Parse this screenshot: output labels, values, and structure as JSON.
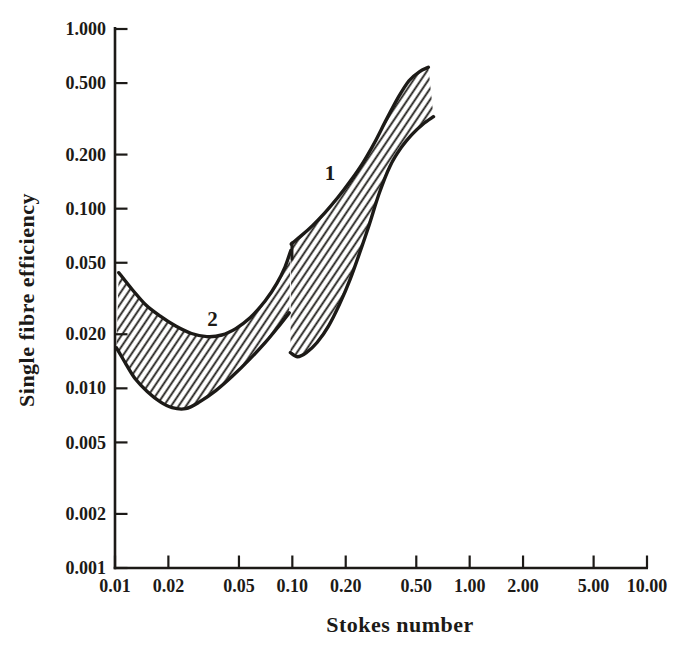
{
  "figure": {
    "background": "#ffffff",
    "ink": "#1c1a17"
  },
  "chart_data": {
    "type": "area",
    "title": "",
    "xlabel": "Stokes number",
    "ylabel": "Single fibre efficiency",
    "x_scale": "log",
    "y_scale": "log",
    "xlim": [
      0.01,
      10.0
    ],
    "ylim": [
      0.001,
      1.0
    ],
    "grid": false,
    "legend": "none",
    "x_ticks": [
      {
        "value": 0.01,
        "label": "0.01"
      },
      {
        "value": 0.02,
        "label": "0.02"
      },
      {
        "value": 0.05,
        "label": "0.05"
      },
      {
        "value": 0.1,
        "label": "0.10"
      },
      {
        "value": 0.2,
        "label": "0.20"
      },
      {
        "value": 0.5,
        "label": "0.50"
      },
      {
        "value": 1.0,
        "label": "1.00"
      },
      {
        "value": 2.0,
        "label": "2.00"
      },
      {
        "value": 5.0,
        "label": "5.00"
      },
      {
        "value": 10.0,
        "label": "10.00"
      }
    ],
    "y_ticks": [
      {
        "value": 1.0,
        "label": "1.000"
      },
      {
        "value": 0.5,
        "label": "0.500"
      },
      {
        "value": 0.2,
        "label": "0.200"
      },
      {
        "value": 0.1,
        "label": "0.100"
      },
      {
        "value": 0.05,
        "label": "0.050"
      },
      {
        "value": 0.02,
        "label": "0.020"
      },
      {
        "value": 0.01,
        "label": "0.010"
      },
      {
        "value": 0.005,
        "label": "0.005"
      },
      {
        "value": 0.002,
        "label": "0.002"
      },
      {
        "value": 0.001,
        "label": "0.001"
      }
    ],
    "bands": [
      {
        "id": "band-1",
        "label": "1",
        "label_at": [
          0.163,
          0.158
        ],
        "upper": [
          [
            0.0985,
            0.0635
          ],
          [
            0.112,
            0.0705
          ],
          [
            0.13,
            0.0805
          ],
          [
            0.152,
            0.0945
          ],
          [
            0.18,
            0.115
          ],
          [
            0.212,
            0.142
          ],
          [
            0.25,
            0.18
          ],
          [
            0.292,
            0.235
          ],
          [
            0.34,
            0.315
          ],
          [
            0.395,
            0.415
          ],
          [
            0.455,
            0.515
          ],
          [
            0.52,
            0.578
          ],
          [
            0.585,
            0.612
          ]
        ],
        "lower": [
          [
            0.0975,
            0.0158
          ],
          [
            0.107,
            0.015
          ],
          [
            0.12,
            0.0158
          ],
          [
            0.138,
            0.018
          ],
          [
            0.16,
            0.0222
          ],
          [
            0.185,
            0.0295
          ],
          [
            0.212,
            0.0405
          ],
          [
            0.24,
            0.057
          ],
          [
            0.272,
            0.082
          ],
          [
            0.31,
            0.123
          ],
          [
            0.355,
            0.172
          ],
          [
            0.41,
            0.218
          ],
          [
            0.475,
            0.26
          ],
          [
            0.545,
            0.295
          ],
          [
            0.625,
            0.325
          ]
        ]
      },
      {
        "id": "band-2",
        "label": "2",
        "label_at": [
          0.0355,
          0.0243
        ],
        "upper": [
          [
            0.0105,
            0.044
          ],
          [
            0.0125,
            0.0355
          ],
          [
            0.015,
            0.029
          ],
          [
            0.018,
            0.0252
          ],
          [
            0.022,
            0.0222
          ],
          [
            0.027,
            0.0202
          ],
          [
            0.033,
            0.0194
          ],
          [
            0.04,
            0.0198
          ],
          [
            0.048,
            0.0215
          ],
          [
            0.058,
            0.0248
          ],
          [
            0.07,
            0.0305
          ],
          [
            0.082,
            0.0385
          ],
          [
            0.091,
            0.0475
          ],
          [
            0.098,
            0.0585
          ]
        ],
        "lower": [
          [
            0.0102,
            0.0168
          ],
          [
            0.0115,
            0.0137
          ],
          [
            0.013,
            0.0113
          ],
          [
            0.0152,
            0.0096
          ],
          [
            0.018,
            0.0084
          ],
          [
            0.021,
            0.0078
          ],
          [
            0.025,
            0.0077
          ],
          [
            0.03,
            0.0084
          ],
          [
            0.037,
            0.0097
          ],
          [
            0.046,
            0.0117
          ],
          [
            0.057,
            0.0144
          ],
          [
            0.07,
            0.0179
          ],
          [
            0.083,
            0.0219
          ],
          [
            0.096,
            0.0263
          ]
        ]
      }
    ],
    "jump_connector": {
      "x": 0.0995,
      "y_from": 0.0525,
      "y_to": 0.0645
    },
    "hatch": {
      "angle_deg": 56,
      "spacing_px": 6.2,
      "stroke_px": 1.8
    }
  }
}
